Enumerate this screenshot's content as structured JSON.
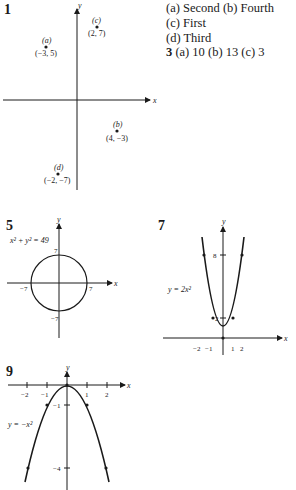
{
  "problem1": {
    "number": "1",
    "points": [
      {
        "tag": "(a)",
        "coord": "(−3, 5)"
      },
      {
        "tag": "(b)",
        "coord": "(4, −3)"
      },
      {
        "tag": "(c)",
        "coord": "(2, 7)"
      },
      {
        "tag": "(d)",
        "coord": "(−2, −7)"
      }
    ],
    "x_label": "x",
    "y_label": "y"
  },
  "answers": {
    "line1": "(a) Second  (b) Fourth",
    "line2": "(c) First",
    "line3": "(d) Third",
    "p3_number": "3",
    "line4": "(a) 10  (b) 13  (c) 3"
  },
  "problem5": {
    "number": "5",
    "equation": "x² + y² = 49",
    "ticks": {
      "top": "7",
      "bottom": "−7",
      "left": "−7",
      "right": "7"
    },
    "x_label": "x",
    "y_label": "y"
  },
  "problem7": {
    "number": "7",
    "equation": "y = 2x²",
    "y_ticks": [
      "8",
      "2"
    ],
    "x_ticks": [
      "−2",
      "−1",
      "1",
      "2"
    ],
    "x_label": "x",
    "y_label": "y"
  },
  "problem9": {
    "number": "9",
    "equation": "y = −x²",
    "y_ticks": [
      "−1",
      "−4"
    ],
    "x_ticks": [
      "−2",
      "−1",
      "1",
      "2"
    ],
    "x_label": "x",
    "y_label": "y"
  }
}
